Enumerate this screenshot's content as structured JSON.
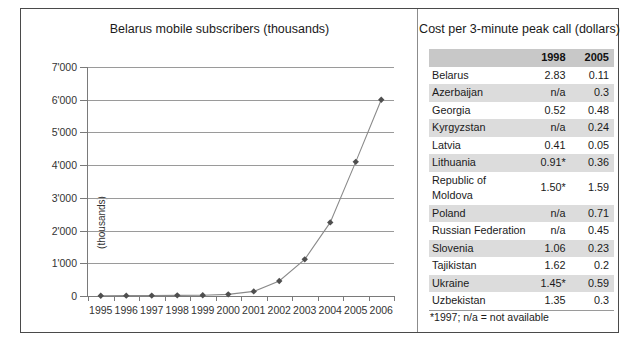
{
  "chart_data": {
    "type": "line",
    "title": "Belarus mobile subscribers (thousands)",
    "xlabel": "",
    "ylabel": "(thousands)",
    "categories": [
      "1995",
      "1996",
      "1997",
      "1998",
      "1999",
      "2000",
      "2001",
      "2002",
      "2003",
      "2004",
      "2005",
      "2006"
    ],
    "values": [
      8,
      10,
      12,
      20,
      25,
      50,
      140,
      460,
      1120,
      2250,
      4100,
      6000
    ],
    "series": [
      {
        "name": "Belarus mobile subscribers",
        "values": [
          8,
          10,
          12,
          20,
          25,
          50,
          140,
          460,
          1120,
          2250,
          4100,
          6000
        ]
      }
    ],
    "ylim": [
      0,
      7000
    ],
    "yticks": [
      0,
      1000,
      2000,
      3000,
      4000,
      5000,
      6000,
      7000
    ],
    "ytick_labels": [
      "0",
      "1'000",
      "2'000",
      "3'000",
      "4'000",
      "5'000",
      "6'000",
      "7'000"
    ],
    "grid": true,
    "legend": "none",
    "marker": "diamond",
    "line_color": "#8a8a8a",
    "marker_color": "#4f4f4f"
  },
  "table_panel": {
    "title": "Cost per 3-minute peak call (dollars)",
    "columns": [
      "",
      "1998",
      "2005"
    ],
    "rows": [
      {
        "country": "Belarus",
        "y1998": "2.83",
        "y2005": "0.11"
      },
      {
        "country": "Azerbaijan",
        "y1998": "n/a",
        "y2005": "0.3"
      },
      {
        "country": "Georgia",
        "y1998": "0.52",
        "y2005": "0.48"
      },
      {
        "country": "Kyrgyzstan",
        "y1998": "n/a",
        "y2005": "0.24"
      },
      {
        "country": "Latvia",
        "y1998": "0.41",
        "y2005": "0.05"
      },
      {
        "country": "Lithuania",
        "y1998": "0.91*",
        "y2005": "0.36"
      },
      {
        "country": "Republic of Moldova",
        "y1998": "1.50*",
        "y2005": "1.59"
      },
      {
        "country": "Poland",
        "y1998": "n/a",
        "y2005": "0.71"
      },
      {
        "country": "Russian Federation",
        "y1998": "n/a",
        "y2005": "0.45"
      },
      {
        "country": "Slovenia",
        "y1998": "1.06",
        "y2005": "0.23"
      },
      {
        "country": "Tajikistan",
        "y1998": "1.62",
        "y2005": "0.2"
      },
      {
        "country": "Ukraine",
        "y1998": "1.45*",
        "y2005": "0.59"
      },
      {
        "country": "Uzbekistan",
        "y1998": "1.35",
        "y2005": "0.3"
      }
    ],
    "footnote": "*1997; n/a = not available"
  },
  "colors": {
    "frame": "#4a4a4a",
    "header_shade": "#c8c8c8",
    "row_shade": "#dcdcdc",
    "gridline": "#9a9a9a"
  }
}
